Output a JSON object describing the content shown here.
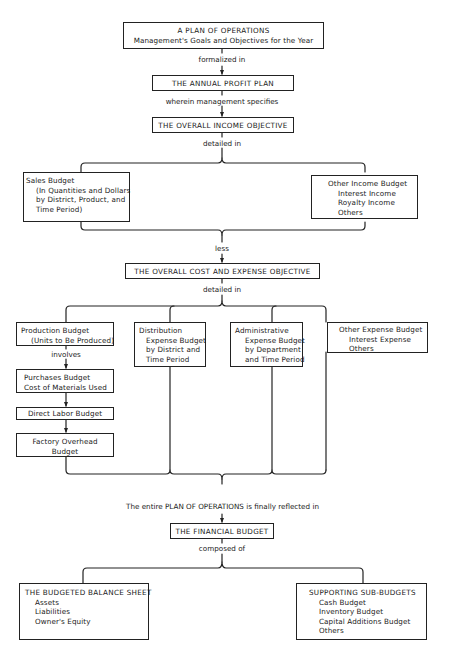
{
  "plan": {
    "title": "A PLAN OF OPERATIONS",
    "subtitle": "Management's Goals and Objectives for the Year"
  },
  "connectors": {
    "formalized": "formalized in",
    "wherein": "wherein management specifies",
    "detailed_income": "detailed in",
    "less": "less",
    "detailed_cost": "detailed in",
    "involves": "involves",
    "finally": "The entire PLAN OF OPERATIONS is finally reflected in",
    "composed": "composed of"
  },
  "profit_plan": {
    "title": "THE ANNUAL PROFIT PLAN"
  },
  "income_objective": {
    "title": "THE OVERALL INCOME OBJECTIVE"
  },
  "sales_budget": {
    "title": "Sales Budget",
    "lines": [
      "(In Quantities and Dollars",
      "by District, Product, and",
      "Time Period)"
    ]
  },
  "other_income": {
    "title": "Other Income Budget",
    "lines": [
      "Interest Income",
      "Royalty Income",
      "Others"
    ]
  },
  "cost_objective": {
    "title": "THE OVERALL COST AND EXPENSE OBJECTIVE"
  },
  "production_budget": {
    "title": "Production Budget",
    "lines": [
      "(Units to Be Produced)"
    ]
  },
  "purchases_budget": {
    "lines": [
      "Purchases Budget",
      "Cost of Materials Used"
    ]
  },
  "direct_labor": {
    "title": "Direct Labor Budget"
  },
  "factory_overhead": {
    "lines": [
      "Factory Overhead",
      "Budget"
    ]
  },
  "distribution_budget": {
    "title": "Distribution",
    "lines": [
      "Expense Budget",
      "by District and",
      "Time Period"
    ]
  },
  "administrative_budget": {
    "title": "Administrative",
    "lines": [
      "Expense Budget",
      "by Department",
      "and Time Period"
    ]
  },
  "other_expense": {
    "title": "Other Expense Budget",
    "lines": [
      "Interest Expense",
      "Others"
    ]
  },
  "financial_budget": {
    "title": "THE FINANCIAL BUDGET"
  },
  "balance_sheet": {
    "title": "THE BUDGETED BALANCE SHEET",
    "lines": [
      "Assets",
      "Liabilities",
      "Owner's Equity"
    ]
  },
  "sub_budgets": {
    "title": "SUPPORTING SUB-BUDGETS",
    "lines": [
      "Cash Budget",
      "Inventory Budget",
      "Capital Additions Budget",
      "Others"
    ]
  }
}
